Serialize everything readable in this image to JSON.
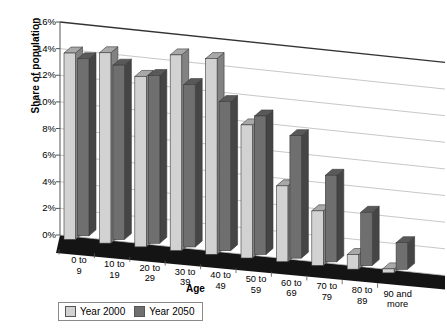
{
  "chart_data": {
    "type": "bar",
    "title": "",
    "subtitle": "",
    "xlabel": "Age",
    "ylabel": "Share of population",
    "ylim": [
      0,
      16
    ],
    "ytick_labels": [
      "0%",
      "2%",
      "4%",
      "6%",
      "8%",
      "10%",
      "12%",
      "14%",
      "16%"
    ],
    "ytick_values": [
      0,
      2,
      4,
      6,
      8,
      10,
      12,
      14,
      16
    ],
    "grid": true,
    "legend_position": "bottom-left",
    "categories": [
      "0 to\n9",
      "10 to\n19",
      "20 to\n29",
      "30 to\n39",
      "40 to\n49",
      "50 to\n59",
      "60 to\n69",
      "70 to\n79",
      "80 to\n89",
      "90 and\nmore"
    ],
    "series": [
      {
        "name": "Year 2000",
        "color": "#d2d2d2",
        "values": [
          14.0,
          14.3,
          12.8,
          14.7,
          14.7,
          10.0,
          5.7,
          4.1,
          1.1,
          0.3
        ]
      },
      {
        "name": "Year 2050",
        "color": "#6f6f6f",
        "values": [
          13.3,
          13.1,
          12.6,
          12.2,
          11.2,
          10.4,
          9.2,
          6.5,
          4.0,
          2.0
        ]
      }
    ]
  },
  "legend": {
    "items": [
      {
        "label": "Year 2000",
        "swatch": "light-gray-swatch"
      },
      {
        "label": "Year 2050",
        "swatch": "dark-gray-swatch"
      }
    ]
  },
  "axes": {
    "y_title": "Share of population",
    "x_title": "Age"
  }
}
